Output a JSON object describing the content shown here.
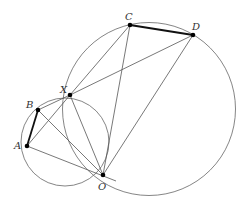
{
  "diagram": {
    "type": "geometry",
    "colors": {
      "line": "#555555",
      "thick": "#111111",
      "point": "#000000",
      "label": "#333333"
    },
    "points": {
      "A": {
        "label": "A",
        "x": 27,
        "y": 146
      },
      "B": {
        "label": "B",
        "x": 38,
        "y": 110
      },
      "X": {
        "label": "X",
        "x": 70,
        "y": 95
      },
      "O": {
        "label": "O",
        "x": 103,
        "y": 175
      },
      "C": {
        "label": "C",
        "x": 130,
        "y": 25
      },
      "D": {
        "label": "D",
        "x": 193,
        "y": 35
      }
    },
    "circles": [
      {
        "name": "small",
        "through": [
          "A",
          "B",
          "X",
          "O"
        ],
        "cx": 65,
        "cy": 142,
        "r": 44
      },
      {
        "name": "large",
        "through": [
          "X",
          "C",
          "D",
          "O"
        ],
        "cx": 149,
        "cy": 109,
        "r": 86.5
      }
    ],
    "segments": [
      [
        "A",
        "B",
        "thick"
      ],
      [
        "C",
        "D",
        "thick"
      ],
      [
        "X",
        "C"
      ],
      [
        "X",
        "D"
      ],
      [
        "X",
        "A"
      ],
      [
        "X",
        "B"
      ],
      [
        "X",
        "O"
      ],
      [
        "C",
        "O"
      ],
      [
        "D",
        "O"
      ],
      [
        "A",
        "O"
      ],
      [
        "B",
        "O"
      ]
    ]
  }
}
